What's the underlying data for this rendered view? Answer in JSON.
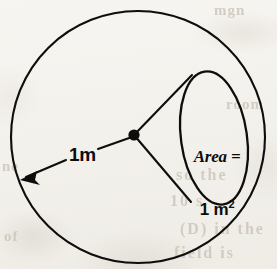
{
  "figure": {
    "kind": "steradian-solid-angle-diagram",
    "background_color": "#f5f3ef",
    "ink_color": "#0c0c0c",
    "sphere": {
      "name": "unit-sphere-outline",
      "center_x": 138,
      "center_y": 137,
      "radius": 127
    },
    "patch": {
      "name": "surface-area-patch",
      "center_x": 214,
      "center_y": 138,
      "radius_x": 33,
      "radius_y": 67,
      "rotation_deg": -8
    },
    "apex": {
      "name": "sphere-center-point",
      "x": 134,
      "y": 135,
      "radius": 5.5
    },
    "cone_edges": [
      {
        "name": "cone-edge-upper",
        "x1": 134,
        "y1": 135,
        "x2": 191,
        "y2": 76
      },
      {
        "name": "cone-edge-lower",
        "x1": 134,
        "y1": 135,
        "x2": 190,
        "y2": 201
      }
    ],
    "radius_leader": {
      "name": "radius-leader-line",
      "x1": 134,
      "y1": 135,
      "x2": 68,
      "y2": 159,
      "arrow_x": 22,
      "arrow_y": 179
    }
  },
  "labels": {
    "radius": "1m",
    "area_word": "Area =",
    "area_value": "1 m",
    "area_exponent": "2"
  },
  "ghost_text": {
    "top_right": "mgn",
    "mid_right": "room",
    "left": "ne",
    "line1": "so the",
    "line2": "10 s",
    "line3": "(D) in the",
    "line4": "field is",
    "bottom_left": "of"
  }
}
